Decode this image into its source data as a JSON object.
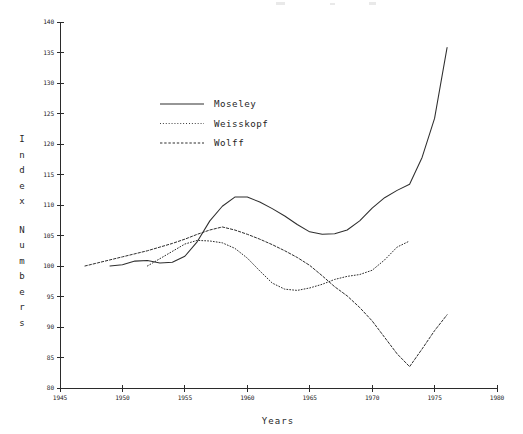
{
  "chart_data": {
    "type": "line",
    "title": "",
    "xlabel": "Years",
    "ylabel": "Index Numbers",
    "xlim": [
      1945,
      1980
    ],
    "ylim": [
      80,
      140
    ],
    "xticks": [
      1945,
      1950,
      1955,
      1960,
      1965,
      1970,
      1975,
      1980
    ],
    "xticklabels": [
      "1945",
      "1950",
      "1955",
      "1960",
      "1965",
      "1970",
      "1975",
      "1980"
    ],
    "yticks": [
      80,
      85,
      90,
      95,
      100,
      105,
      110,
      115,
      120,
      125,
      130,
      135,
      140
    ],
    "yticklabels": [
      "80",
      "85",
      "90",
      "95",
      "100",
      "105",
      "110",
      "115",
      "120",
      "125",
      "130",
      "135",
      "140"
    ],
    "grid": false,
    "legend_position": "upper-left-inside",
    "series": [
      {
        "name": "Moseley",
        "style": "solid",
        "color": "#2e2e2e",
        "x": [
          1949,
          1950,
          1951,
          1952,
          1953,
          1954,
          1955,
          1956,
          1957,
          1958,
          1959,
          1960,
          1961,
          1962,
          1963,
          1964,
          1965,
          1966,
          1967,
          1968,
          1969,
          1970,
          1971,
          1972,
          1973,
          1974,
          1975,
          1976
        ],
        "y": [
          100.0,
          100.2,
          100.8,
          100.9,
          100.5,
          100.6,
          101.6,
          104.0,
          107.4,
          109.8,
          111.3,
          111.3,
          110.5,
          109.4,
          108.2,
          106.8,
          105.6,
          105.2,
          105.3,
          105.9,
          107.4,
          109.5,
          111.2,
          112.4,
          113.4,
          117.8,
          124.2,
          135.8
        ]
      },
      {
        "name": "Weisskopf",
        "style": "dotted",
        "color": "#2e2e2e",
        "x": [
          1952,
          1953,
          1954,
          1955,
          1956,
          1957,
          1958,
          1959,
          1960,
          1961,
          1962,
          1963,
          1964,
          1965,
          1966,
          1967,
          1968,
          1969,
          1970,
          1971,
          1972,
          1973
        ],
        "y": [
          100.0,
          101.2,
          102.4,
          103.6,
          104.2,
          104.1,
          103.8,
          102.9,
          101.3,
          99.2,
          97.2,
          96.2,
          96.0,
          96.4,
          97.0,
          97.8,
          98.3,
          98.6,
          99.3,
          101.0,
          103.1,
          104.1
        ]
      },
      {
        "name": "Wolff",
        "style": "dashed",
        "color": "#2e2e2e",
        "x": [
          1947,
          1948,
          1949,
          1950,
          1951,
          1952,
          1953,
          1954,
          1955,
          1956,
          1957,
          1958,
          1959,
          1960,
          1961,
          1962,
          1963,
          1964,
          1965,
          1966,
          1967,
          1968,
          1969,
          1970,
          1971,
          1972,
          1973,
          1974,
          1975,
          1976
        ],
        "y": [
          100.0,
          100.5,
          101.0,
          101.5,
          102.0,
          102.5,
          103.1,
          103.7,
          104.4,
          105.2,
          105.9,
          106.4,
          105.9,
          105.2,
          104.4,
          103.5,
          102.5,
          101.4,
          100.1,
          98.4,
          96.6,
          95.1,
          93.2,
          91.0,
          88.3,
          85.6,
          83.5,
          86.4,
          89.4,
          92.0
        ]
      }
    ]
  },
  "legend": {
    "entries": [
      {
        "label": "Moseley",
        "style": "solid"
      },
      {
        "label": "Weisskopf",
        "style": "dotted"
      },
      {
        "label": "Wolff",
        "style": "dashed"
      }
    ]
  },
  "axes": {
    "x_title": "Years",
    "y_title": "Index Numbers"
  }
}
